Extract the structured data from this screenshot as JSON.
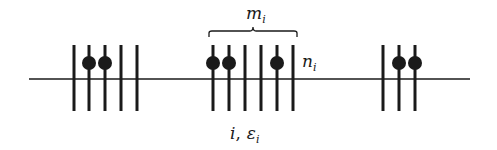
{
  "diagram": {
    "colors": {
      "ink": "#1a1a1a",
      "background": "#ffffff"
    },
    "axis": {
      "x1": 29,
      "x2": 470,
      "y": 79
    },
    "line_extent": {
      "y1": 45,
      "y2": 111
    },
    "dot": {
      "y": 63,
      "r": 7
    },
    "groups": [
      {
        "id": "left",
        "lines_x": [
          74,
          89,
          105,
          121,
          137
        ],
        "dots_x": [
          89,
          105
        ]
      },
      {
        "id": "center",
        "lines_x": [
          213,
          229,
          245,
          261,
          277,
          293
        ],
        "dots_x": [
          213,
          229,
          277
        ]
      },
      {
        "id": "right",
        "lines_x": [
          383,
          399,
          415
        ],
        "dots_x": [
          399,
          415
        ]
      }
    ],
    "brace": {
      "x1": 209,
      "x2": 297,
      "y_top": 30,
      "y_bottom": 37
    },
    "labels": {
      "m": {
        "base": "m",
        "sub": "i"
      },
      "n": {
        "base": "n",
        "sub": "i"
      },
      "bottom": {
        "first": "i",
        "sep": ",",
        "base": "ε",
        "sub": "i"
      }
    }
  }
}
